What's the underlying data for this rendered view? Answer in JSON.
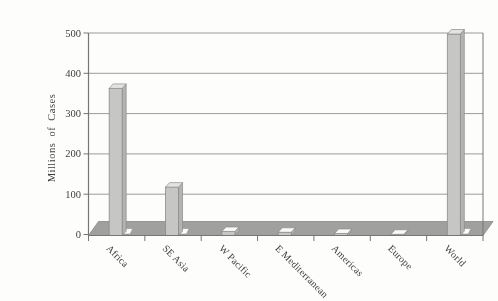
{
  "figure": {
    "background": "#fdfdfc",
    "kind": "scanned textbook bar chart"
  },
  "chart_data": {
    "type": "bar",
    "title": "",
    "categories": [
      "Africa",
      "SE Asia",
      "W Pacific",
      "E Mediterranean",
      "Americas",
      "Europe",
      "World"
    ],
    "values": [
      365,
      120,
      10,
      8,
      5,
      3,
      500
    ],
    "xlabel": "",
    "ylabel": "Millions of Cases",
    "yticks": [
      0,
      100,
      200,
      300,
      400,
      500
    ],
    "ylim": [
      0,
      500
    ],
    "grid": true,
    "legend": "none",
    "category_label_rotation_deg": 45,
    "style": {
      "effect": "pseudo-3d",
      "bar_front": "#c6c7c5",
      "bar_top": "#e3e3e1",
      "bar_top_small": "#f8f8f6",
      "bar_side": "#b3b4b2",
      "bar_outline": "#8b8b8b",
      "base_highlight": "#fafaf8",
      "floor": "#a0a09e",
      "floor_outline": "#898989",
      "gridline": "#9b9b9b",
      "axis": "#767676",
      "text": "#3e3e3e"
    }
  }
}
